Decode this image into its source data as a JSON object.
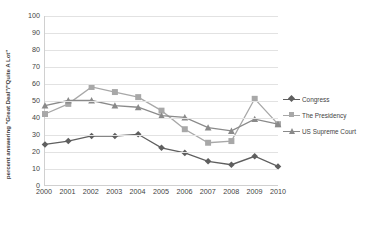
{
  "chart_data": {
    "type": "line",
    "title": "",
    "subtitle": "",
    "xlabel": "",
    "ylabel": "percent answering \"Great Deal\"/\"Quite A Lot\"",
    "x": [
      "2000",
      "2001",
      "2002",
      "2003",
      "2004",
      "2005",
      "2006",
      "2007",
      "2008",
      "2009",
      "2010"
    ],
    "categories": [
      "2000",
      "2001",
      "2002",
      "2003",
      "2004",
      "2005",
      "2006",
      "2007",
      "2008",
      "2009",
      "2010"
    ],
    "xlim": [
      2000,
      2010
    ],
    "ylim": [
      0,
      100
    ],
    "yticks": [
      0,
      10,
      20,
      30,
      40,
      50,
      60,
      70,
      80,
      90,
      100
    ],
    "grid": "horizontal",
    "legend_position": "right",
    "series": [
      {
        "name": "Congress",
        "marker": "diamond",
        "color": "#5f5f5f",
        "values": [
          24,
          26,
          29,
          29,
          30,
          22,
          19,
          14,
          12,
          17,
          11
        ]
      },
      {
        "name": "The Presidency",
        "marker": "square",
        "color": "#a8a8a8",
        "values": [
          42,
          48,
          58,
          55,
          52,
          44,
          33,
          25,
          26,
          51,
          36
        ]
      },
      {
        "name": "US Supreme Court",
        "marker": "triangle",
        "color": "#8a8a8a",
        "values": [
          47,
          50,
          50,
          47,
          46,
          41,
          40,
          34,
          32,
          39,
          36
        ]
      }
    ]
  },
  "axis": {
    "y_title": "percent answering \"Great Deal\"/\"Quite A Lot\"",
    "y_labels": [
      "100",
      "90",
      "80",
      "70",
      "60",
      "50",
      "40",
      "30",
      "20",
      "10",
      "0"
    ],
    "x_labels": [
      "2000",
      "2001",
      "2002",
      "2003",
      "2004",
      "2005",
      "2006",
      "2007",
      "2008",
      "2009",
      "2010"
    ]
  },
  "legend": {
    "items": [
      {
        "label": "Congress",
        "marker": "diamond-marker",
        "color": "#5f5f5f"
      },
      {
        "label": "The Presidency",
        "marker": "square-marker",
        "color": "#a8a8a8"
      },
      {
        "label": "US Supreme Court",
        "marker": "triangle-marker",
        "color": "#8a8a8a"
      }
    ]
  },
  "colors": {
    "background": "#ffffff",
    "gridline": "#e2e2e2",
    "axis": "#d0d0d0",
    "text": "#3f3f3f"
  }
}
